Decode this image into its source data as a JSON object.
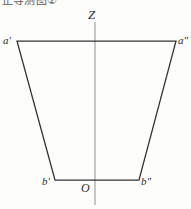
{
  "figure": {
    "caption_fragment": "正等测图②",
    "background_color": "#fdfdfc",
    "width": 191,
    "height": 209
  },
  "axis": {
    "vertical_label": "Z",
    "origin_label": "O",
    "color": "#9a9a9a"
  },
  "shape": {
    "name": "trapezoid",
    "stroke_color": "#333333",
    "vertices": [
      {
        "id": "a-prime",
        "label": "a'",
        "x": 17,
        "y": 41
      },
      {
        "id": "a-double-prime",
        "label": "a\"",
        "x": 176,
        "y": 41
      },
      {
        "id": "b-double-prime",
        "label": "b\"",
        "x": 139,
        "y": 180
      },
      {
        "id": "b-prime",
        "label": "b'",
        "x": 55,
        "y": 180
      }
    ]
  },
  "labels": {
    "a_prime": "a'",
    "a_double_prime": "a\"",
    "b_prime": "b'",
    "b_double_prime": "b\"",
    "z_axis": "Z",
    "origin": "O"
  }
}
